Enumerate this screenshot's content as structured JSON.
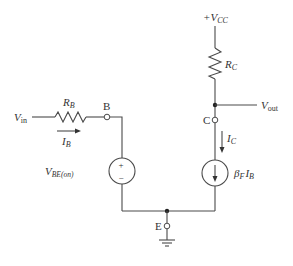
{
  "diagram": {
    "type": "circuit-schematic",
    "colors": {
      "wire": "#4a4a4a",
      "text": "#333333",
      "background": "#ffffff"
    },
    "supply": {
      "label_prefix": "+V",
      "label_sub": "CC"
    },
    "input": {
      "label_main": "V",
      "label_sub": "in"
    },
    "output": {
      "label_main": "V",
      "label_sub": "out"
    },
    "resistors": [
      {
        "id": "RB",
        "label_main": "R",
        "label_sub": "B"
      },
      {
        "id": "RC",
        "label_main": "R",
        "label_sub": "C"
      }
    ],
    "nodes": {
      "base": "B",
      "collector": "C",
      "emitter": "E"
    },
    "currents": {
      "base": {
        "label_main": "I",
        "label_sub": "B"
      },
      "collector": {
        "label_main": "I",
        "label_sub": "C"
      }
    },
    "voltage_source": {
      "label_main": "V",
      "label_sub": "BE(on)",
      "plus": "+",
      "minus": "−"
    },
    "current_source": {
      "label_beta": "β",
      "beta_sub": "F",
      "label_i": "I",
      "i_sub": "B"
    }
  }
}
